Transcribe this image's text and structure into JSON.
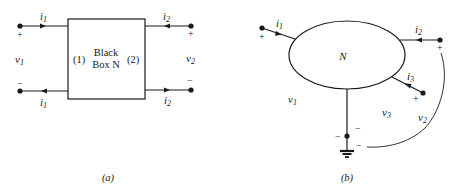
{
  "figure_a": {
    "caption": "(a)",
    "box_line1": "Black",
    "box_line2": "Box N",
    "port1_label": "(1)",
    "port2_label": "(2)",
    "top_left_current": "i",
    "top_left_current_sub": "1",
    "bottom_left_current": "i",
    "bottom_left_current_sub": "1",
    "top_right_current": "i",
    "top_right_current_sub": "2",
    "bottom_right_current": "i",
    "bottom_right_current_sub": "2",
    "left_voltage": "v",
    "left_voltage_sub": "1",
    "right_voltage": "v",
    "right_voltage_sub": "2",
    "plus": "+",
    "minus": "−"
  },
  "figure_b": {
    "caption": "(b)",
    "network_label": "N",
    "current_1": "i",
    "current_1_sub": "1",
    "current_2": "i",
    "current_2_sub": "2",
    "current_3": "i",
    "current_3_sub": "3",
    "voltage_1": "v",
    "voltage_1_sub": "1",
    "voltage_2": "v",
    "voltage_2_sub": "2",
    "voltage_3": "v",
    "voltage_3_sub": "3",
    "plus": "+",
    "minus": "−"
  }
}
